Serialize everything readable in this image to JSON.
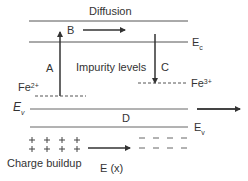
{
  "diagram": {
    "title_label": "Diffusion",
    "labels": {
      "B": "B",
      "A": "A",
      "C": "C",
      "D": "D",
      "impurity": "Impurity levels",
      "charge": "Charge buildup",
      "field": "E (x)"
    },
    "levels": {
      "conduction": {
        "main": "E",
        "sub": "c"
      },
      "valence_left": {
        "main": "E",
        "sub": "v"
      },
      "valence_right": {
        "main": "E",
        "sub": "v"
      },
      "fe2": {
        "main": "Fe",
        "sup": "2+"
      },
      "fe3": {
        "main": "Fe",
        "sup": "3+"
      }
    },
    "charges": {
      "positive": [
        "+",
        "+",
        "+",
        "+"
      ],
      "negative": [
        "−",
        "−",
        "−",
        "−"
      ]
    },
    "colors": {
      "line": "#444444",
      "text": "#333333",
      "background": "#ffffff"
    }
  }
}
